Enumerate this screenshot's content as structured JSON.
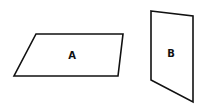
{
  "diagram": {
    "width": 202,
    "height": 108,
    "background": "#ffffff",
    "stroke_color": "#111111",
    "shapes": [
      {
        "id": "A",
        "type": "parallelogram",
        "label": "A",
        "points": "36,34 123,34 118,76 14,76",
        "label_pos": [
          72,
          55
        ]
      },
      {
        "id": "B",
        "type": "quadrilateral",
        "label": "B",
        "points": "151,11 193,16 193,102 151,80",
        "label_pos": [
          171,
          53
        ]
      }
    ]
  }
}
